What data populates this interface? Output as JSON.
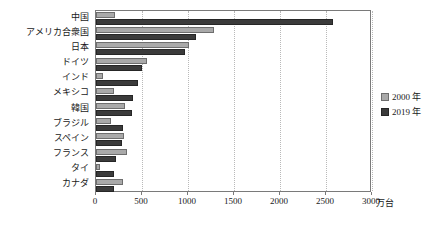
{
  "chart_data": {
    "type": "bar",
    "orientation": "horizontal",
    "title": "",
    "xlabel": "",
    "ylabel": "",
    "unit": "万台",
    "xlim": [
      0,
      3000
    ],
    "xticks": [
      0,
      500,
      1000,
      1500,
      2000,
      2500,
      3000
    ],
    "xtick_labels": [
      "0",
      "500",
      "1000",
      "1500",
      "2000",
      "2500",
      "3000"
    ],
    "grid": true,
    "grid_axis": "x",
    "legend_position": "right",
    "categories": [
      "中国",
      "アメリカ合衆国",
      "日本",
      "ドイツ",
      "インド",
      "メキシコ",
      "韓国",
      "ブラジル",
      "スペイン",
      "フランス",
      "タイ",
      "カナダ"
    ],
    "series": [
      {
        "name": "2000 年",
        "color": "#a9a9a9",
        "values": [
          205,
          1280,
          1014,
          553,
          80,
          193,
          311,
          168,
          303,
          334,
          41,
          296
        ]
      },
      {
        "name": "2019 年",
        "color": "#3b3b3b",
        "values": [
          2572,
          1088,
          968,
          497,
          452,
          399,
          395,
          294,
          282,
          220,
          201,
          192
        ]
      }
    ]
  },
  "legend": {
    "items": [
      {
        "label": "2000 年",
        "series": "2000"
      },
      {
        "label": "2019 年",
        "series": "2019"
      }
    ]
  },
  "axis": {
    "unit_label": "万台"
  }
}
